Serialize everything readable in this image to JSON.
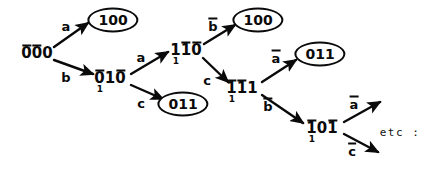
{
  "diagram": {
    "stroke_color": "#0a0a0a",
    "background_color": "#ffffff",
    "nodes": [
      {
        "id": "root",
        "text": "0̅0̅0",
        "digits": [
          "0",
          "0",
          "0"
        ],
        "bars": [
          true,
          true,
          false
        ],
        "subscript": "",
        "circled": false,
        "x": 37,
        "y": 53
      },
      {
        "id": "n100-top-left",
        "text": "100",
        "digits": [
          "1",
          "0",
          "0"
        ],
        "bars": [
          false,
          false,
          false
        ],
        "subscript": "",
        "circled": true,
        "x": 113,
        "y": 20
      },
      {
        "id": "n010",
        "text": "0̅10̅",
        "digits": [
          "0",
          "1",
          "0"
        ],
        "bars": [
          true,
          false,
          true
        ],
        "subscript": "1",
        "circled": false,
        "x": 110,
        "y": 78
      },
      {
        "id": "n011-left",
        "text": "011",
        "digits": [
          "0",
          "1",
          "1"
        ],
        "bars": [
          false,
          false,
          false
        ],
        "subscript": "",
        "circled": true,
        "x": 183,
        "y": 104
      },
      {
        "id": "n110",
        "text": "11̅0̅",
        "digits": [
          "1",
          "1",
          "0"
        ],
        "bars": [
          false,
          true,
          true
        ],
        "subscript": "1",
        "circled": false,
        "x": 186,
        "y": 50
      },
      {
        "id": "n100-top-right",
        "text": "100",
        "digits": [
          "1",
          "0",
          "0"
        ],
        "bars": [
          false,
          false,
          false
        ],
        "subscript": "",
        "circled": true,
        "x": 258,
        "y": 20
      },
      {
        "id": "n111",
        "text": "1̅1̅1",
        "digits": [
          "1",
          "1",
          "1"
        ],
        "bars": [
          true,
          true,
          false
        ],
        "subscript": "1",
        "circled": false,
        "x": 242,
        "y": 88
      },
      {
        "id": "n011-right",
        "text": "011",
        "digits": [
          "0",
          "1",
          "1"
        ],
        "bars": [
          false,
          false,
          false
        ],
        "subscript": "",
        "circled": true,
        "x": 320,
        "y": 54
      },
      {
        "id": "n101",
        "text": "1̅01̅",
        "digits": [
          "1",
          "0",
          "1"
        ],
        "bars": [
          true,
          false,
          true
        ],
        "subscript": "1",
        "circled": false,
        "x": 322,
        "y": 128
      }
    ],
    "edges": [
      {
        "id": "e-root-a",
        "label": "a",
        "barred": false,
        "x1": 54,
        "y1": 47,
        "x2": 88,
        "y2": 23,
        "label_x": 66,
        "label_y": 26
      },
      {
        "id": "e-root-b",
        "label": "b",
        "barred": false,
        "x1": 54,
        "y1": 60,
        "x2": 93,
        "y2": 74,
        "label_x": 66,
        "label_y": 77
      },
      {
        "id": "e-010-a",
        "label": "a",
        "barred": false,
        "x1": 131,
        "y1": 74,
        "x2": 168,
        "y2": 52,
        "label_x": 141,
        "label_y": 57
      },
      {
        "id": "e-010-c",
        "label": "c",
        "barred": false,
        "x1": 131,
        "y1": 85,
        "x2": 163,
        "y2": 99,
        "label_x": 141,
        "label_y": 103
      },
      {
        "id": "e-110-b",
        "label": "b",
        "barred": true,
        "x1": 204,
        "y1": 44,
        "x2": 235,
        "y2": 25,
        "label_x": 213,
        "label_y": 26
      },
      {
        "id": "e-110-c",
        "label": "c",
        "barred": false,
        "x1": 203,
        "y1": 58,
        "x2": 228,
        "y2": 82,
        "label_x": 207,
        "label_y": 80
      },
      {
        "id": "e-111-a",
        "label": "a",
        "barred": true,
        "x1": 262,
        "y1": 82,
        "x2": 296,
        "y2": 60,
        "label_x": 276,
        "label_y": 58
      },
      {
        "id": "e-111-b",
        "label": "b",
        "barred": true,
        "x1": 262,
        "y1": 95,
        "x2": 303,
        "y2": 123,
        "label_x": 268,
        "label_y": 106
      },
      {
        "id": "e-101-a",
        "label": "a",
        "barred": true,
        "x1": 344,
        "y1": 122,
        "x2": 380,
        "y2": 102,
        "label_x": 354,
        "label_y": 104
      },
      {
        "id": "e-101-c",
        "label": "c",
        "barred": true,
        "x1": 344,
        "y1": 134,
        "x2": 378,
        "y2": 152,
        "label_x": 352,
        "label_y": 151
      }
    ],
    "annotations": [
      {
        "id": "etc-note",
        "text": "etc :",
        "x": 400,
        "y": 132
      }
    ]
  }
}
